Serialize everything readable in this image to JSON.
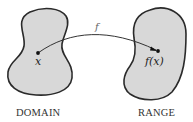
{
  "diagram": {
    "type": "function-mapping",
    "domain": {
      "label": "DOMAIN",
      "point_label": "x",
      "fill_color": "#d8d8d8"
    },
    "range": {
      "label": "RANGE",
      "point_label": "f(x)",
      "fill_color": "#d8d8d8"
    },
    "mapping": {
      "label": "f",
      "from": "x",
      "to": "f(x)"
    }
  }
}
